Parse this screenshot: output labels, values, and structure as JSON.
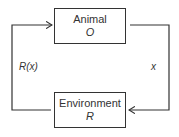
{
  "diagram": {
    "nodes": [
      {
        "id": "animal",
        "label": "Animal",
        "symbol": "O"
      },
      {
        "id": "environment",
        "label": "Environment",
        "symbol": "R"
      }
    ],
    "edges": [
      {
        "from": "animal",
        "to": "environment",
        "label": "x"
      },
      {
        "from": "environment",
        "to": "animal",
        "label": "R(x)"
      }
    ],
    "colors": {
      "stroke": "#333333",
      "background": "#ffffff"
    }
  }
}
